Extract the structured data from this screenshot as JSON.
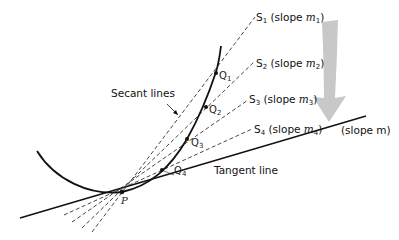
{
  "figure": {
    "labels": {
      "secant_lines": "Secant lines",
      "tangent_line": "Tangent line",
      "tangent_slope": "(slope m)",
      "point_p": "P"
    },
    "secants": [
      {
        "name": "S",
        "index": "1",
        "slope_text": "(slope ",
        "slope_var": "m",
        "slope_sub": "1",
        "close": ")"
      },
      {
        "name": "S",
        "index": "2",
        "slope_text": "(slope ",
        "slope_var": "m",
        "slope_sub": "2",
        "close": ")"
      },
      {
        "name": "S",
        "index": "3",
        "slope_text": "(slope ",
        "slope_var": "m",
        "slope_sub": "3",
        "close": ")"
      },
      {
        "name": "S",
        "index": "4",
        "slope_text": "(slope ",
        "slope_var": "m",
        "slope_sub": "4",
        "close": ")"
      }
    ],
    "points": [
      {
        "label": "Q",
        "sub": "1"
      },
      {
        "label": "Q",
        "sub": "2"
      },
      {
        "label": "Q",
        "sub": "3"
      },
      {
        "label": "Q",
        "sub": "4"
      }
    ],
    "colors": {
      "line": "#111111",
      "dashed": "#333333",
      "arrow": "#c8c8c8"
    }
  }
}
